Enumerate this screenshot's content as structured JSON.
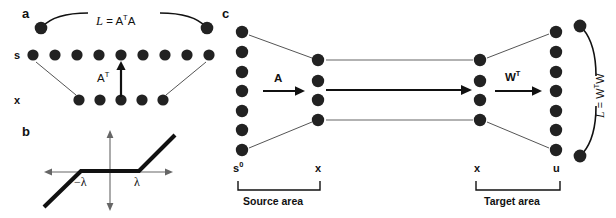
{
  "figure": {
    "width": 616,
    "height": 218,
    "background": "#ffffff",
    "node_color": "#222222",
    "line_color": "#555555",
    "bold_color": "#111111"
  },
  "panels": {
    "a": {
      "label": "a",
      "top_equation": "L = AᵀA",
      "arrow_label": "Aᵀ",
      "row_labels": {
        "top": "s",
        "bottom": "x"
      },
      "top_row_node_count": 9,
      "bottom_row_node_count": 5,
      "end_node_count": 2
    },
    "b": {
      "label": "b",
      "neg_lambda": "−λ",
      "pos_lambda": "λ"
    },
    "c": {
      "label": "c",
      "columns": [
        {
          "name": "s0",
          "label": "s",
          "superscript": "0",
          "node_count": 7
        },
        {
          "name": "x-source",
          "label": "x",
          "superscript": "",
          "node_count": 4
        },
        {
          "name": "x-target",
          "label": "x",
          "superscript": "",
          "node_count": 4
        },
        {
          "name": "u",
          "label": "u",
          "superscript": "",
          "node_count": 7
        }
      ],
      "arrow_labels": {
        "source": "A",
        "target": "Wᵀ"
      },
      "area_labels": {
        "source": "Source area",
        "target": "Target area"
      },
      "side_equation": "L = WᵀW",
      "side_end_node_count": 2
    }
  }
}
